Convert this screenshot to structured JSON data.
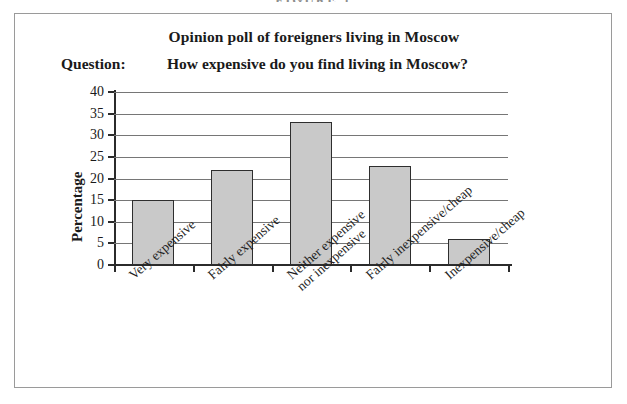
{
  "figure": {
    "caption_sliver": "FIGURE 1",
    "frame_color": "#9a9a9a"
  },
  "header": {
    "title": "Opinion poll of foreigners living in Moscow",
    "question_label": "Question:",
    "question_text": "How expensive do you find living in Moscow?"
  },
  "chart_data": {
    "type": "bar",
    "title": "Opinion poll of foreigners living in Moscow",
    "subtitle": "Question:   How expensive do you find living in Moscow?",
    "xlabel": "",
    "ylabel": "Percentage",
    "ylim": [
      0,
      40
    ],
    "yticks": [
      0,
      5,
      10,
      15,
      20,
      25,
      30,
      35,
      40
    ],
    "ytick_labels": [
      "0",
      "5",
      "10",
      "15",
      "20",
      "25",
      "30",
      "35",
      "40"
    ],
    "grid": "horizontal",
    "legend": "none",
    "bar_fill": "#c9c9c9",
    "bar_edge": "#2e2e2e",
    "categories": [
      "Very expensive",
      "Fairly expensive",
      "Neither expensive\nnor inexpensive",
      "Fairly inexpensive/cheap",
      "Inexpensive/cheap"
    ],
    "values": [
      15,
      22,
      33,
      23,
      6
    ]
  }
}
